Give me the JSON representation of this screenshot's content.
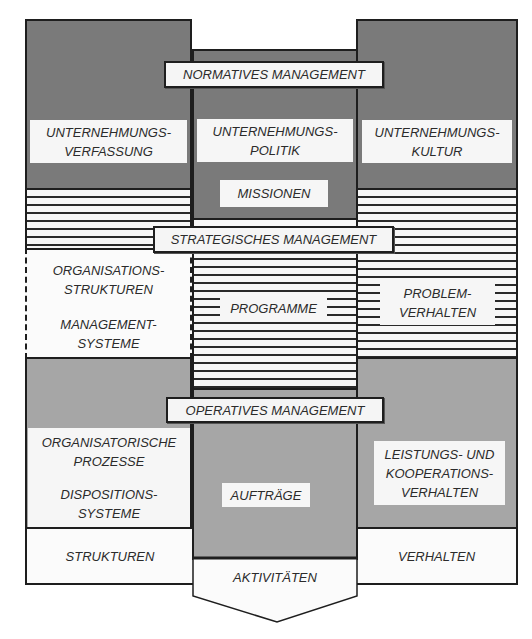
{
  "diagram": {
    "layers": {
      "normative": {
        "title": "NORMATIVES MANAGEMENT",
        "left": [
          "UNTERNEHMUNGS-",
          "VERFASSUNG"
        ],
        "center": [
          "UNTERNEHMUNGS-",
          "POLITIK"
        ],
        "center_sub": "MISSIONEN",
        "right": [
          "UNTERNEHMUNGS-",
          "KULTUR"
        ]
      },
      "strategic": {
        "title": "STRATEGISCHES MANAGEMENT",
        "left_top": [
          "ORGANISATIONS-",
          "STRUKTUREN"
        ],
        "left_bottom": [
          "MANAGEMENT-",
          "SYSTEME"
        ],
        "center": "PROGRAMME",
        "right": [
          "PROBLEM-",
          "VERHALTEN"
        ]
      },
      "operative": {
        "title": "OPERATIVES MANAGEMENT",
        "left_top": [
          "ORGANISATORISCHE",
          "PROZESSE"
        ],
        "left_bottom": [
          "DISPOSITIONS-",
          "SYSTEME"
        ],
        "center": "AUFTRÄGE",
        "right": [
          "LEISTUNGS- UND",
          "KOOPERATIONS-",
          "VERHALTEN"
        ]
      }
    },
    "footer": {
      "left": "STRUKTUREN",
      "center": "AKTIVITÄTEN",
      "right": "VERHALTEN"
    }
  }
}
